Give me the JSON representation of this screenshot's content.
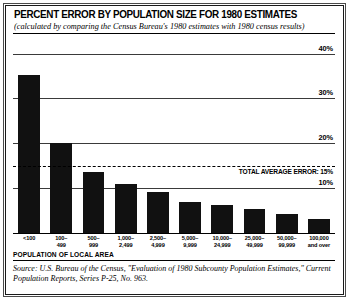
{
  "chart_data": {
    "type": "bar",
    "title": "PERCENT ERROR BY POPULATION SIZE FOR 1980 ESTIMATES",
    "subtitle": "(calculated by comparing the Census Bureau's 1980 estimates with 1980 census results)",
    "xlabel": "POPULATION OF LOCAL AREA",
    "ylabel": "",
    "ylim": [
      0,
      43
    ],
    "grid": true,
    "legend": "none",
    "ytick_labels": [
      "40%",
      "30%",
      "20%",
      "10%"
    ],
    "ytick_values": [
      40,
      30,
      20,
      10
    ],
    "categories": [
      "<100",
      "100–\n499",
      "500–\n999",
      "1,000–\n2,499",
      "2,500–\n4,999",
      "5,000–\n9,999",
      "10,000–\n24,999",
      "25,000–\n49,999",
      "50,000–\n99,999",
      "100,000\nand over"
    ],
    "values": [
      35.2,
      20.1,
      13.7,
      10.9,
      9.2,
      7.0,
      6.2,
      5.4,
      4.3,
      3.2
    ],
    "annotations": [
      {
        "label": "TOTAL AVERAGE ERROR: 15%",
        "value": 15,
        "style": "dashed-horizontal-line"
      }
    ],
    "bar_color": "#111111"
  },
  "source": {
    "line1": "Source: U.S. Bureau of the Census, \"Evaluation of 1980 Subcounty Population Estimates,\"",
    "line2": "Current Population Reports, Series P-25, No. 963."
  }
}
